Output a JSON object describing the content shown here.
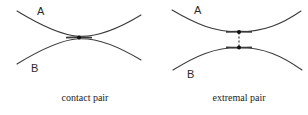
{
  "figure": {
    "background_color": "#ffffff",
    "stroke_color": "#3a3a3a",
    "dot_color": "#111111",
    "width": 308,
    "height": 115,
    "panels": [
      {
        "id": "contact-pair",
        "caption": "contact pair",
        "caption_x": 85,
        "caption_y": 101,
        "labels": [
          {
            "name": "curve-label-a",
            "text": "A",
            "x": 37,
            "y": 15
          },
          {
            "name": "curve-label-b",
            "text": "B",
            "x": 31,
            "y": 72
          }
        ],
        "curves": [
          {
            "name": "curve-a",
            "label": "A",
            "path": "M 17 11 C 40 25, 60 35, 78 36.2 C 96 37.4, 118 29, 141 15"
          },
          {
            "name": "curve-b",
            "label": "B",
            "path": "M 17 64 C 40 50, 60 40, 78 38.8 C 96 37.6, 118 46, 141 60"
          }
        ],
        "tangent_segment": {
          "name": "tangency-overlap-segment",
          "path": "M 66 37.6 C 72 37.2, 86 37.2, 92 37.6"
        },
        "dots": [
          {
            "name": "contact-point",
            "cx": 79,
            "cy": 37.5,
            "r": 2.0
          }
        ],
        "connector": null
      },
      {
        "id": "extremal-pair",
        "caption": "extremal pair",
        "caption_x": 239,
        "caption_y": 101,
        "labels": [
          {
            "name": "curve-label-a",
            "text": "A",
            "x": 194,
            "y": 14
          },
          {
            "name": "curve-label-b",
            "text": "B",
            "x": 187,
            "y": 78
          }
        ],
        "curves": [
          {
            "name": "curve-a",
            "label": "A",
            "path": "M 172 10 C 196 24, 214 31.8, 239 31.8 C 264 31.8, 282 24, 301 11"
          },
          {
            "name": "curve-b",
            "label": "B",
            "path": "M 173 70 C 196 56, 214 47.5, 239 47.5 C 264 47.5, 282 56, 302 70"
          }
        ],
        "tangent_segment": {
          "name": "proximity-flat-segment",
          "path": "M 226 31.9 C 231 31.7, 247 31.7, 252 31.9 M 226 47.4 C 231 47.6, 247 47.6, 252 47.4"
        },
        "dots": [
          {
            "name": "extremal-point-upper",
            "cx": 239,
            "cy": 32.0,
            "r": 2.0
          },
          {
            "name": "extremal-point-lower",
            "cx": 239,
            "cy": 47.4,
            "r": 2.0
          }
        ],
        "connector": {
          "name": "distance-connector",
          "x1": 239,
          "y1": 32.6,
          "x2": 239,
          "y2": 46.8
        }
      }
    ]
  }
}
